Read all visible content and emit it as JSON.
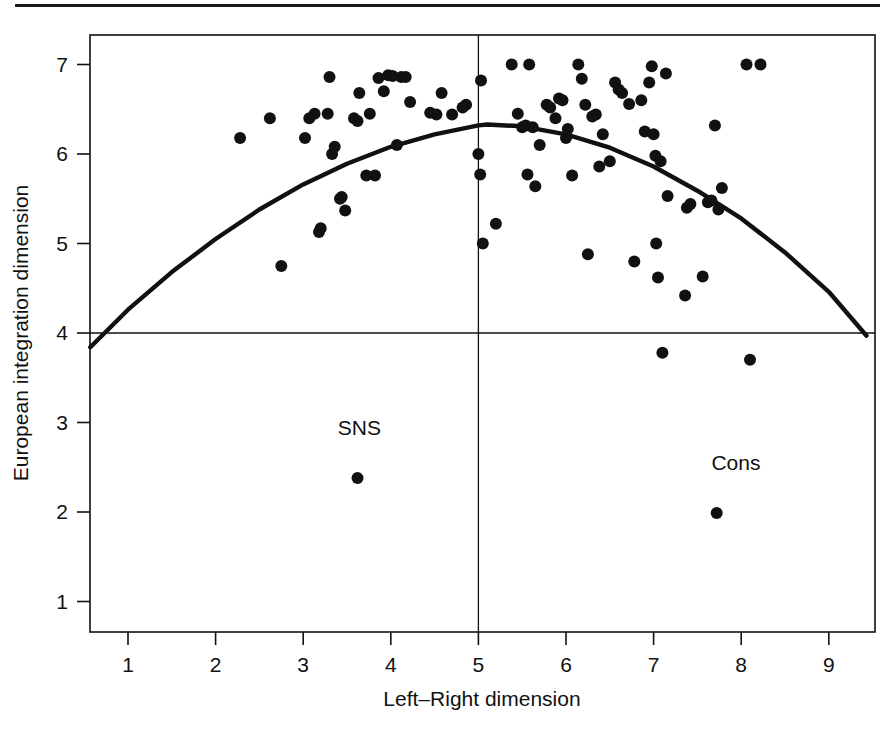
{
  "figure": {
    "background": "#ffffff",
    "ink": "#111111",
    "top_rule": true
  },
  "chart_data": {
    "type": "scatter",
    "title": "",
    "xlabel": "Left–Right dimension",
    "ylabel": "European integration dimension",
    "xlim": [
      0.57,
      9.43
    ],
    "ylim": [
      0.55,
      7.35
    ],
    "xticks": [
      1,
      2,
      3,
      4,
      5,
      6,
      7,
      8,
      9
    ],
    "yticks": [
      1,
      2,
      3,
      4,
      5,
      6,
      7
    ],
    "xticklabels": [
      "1",
      "2",
      "3",
      "4",
      "5",
      "6",
      "7",
      "8",
      "9"
    ],
    "yticklabels": [
      "1",
      "2",
      "3",
      "4",
      "5",
      "6",
      "7"
    ],
    "grid": false,
    "legend": null,
    "reference_lines": [
      {
        "name": "horizontal-reference-line",
        "orientation": "horizontal",
        "value": 4.0
      },
      {
        "name": "vertical-reference-line",
        "orientation": "vertical",
        "value": 5.0
      }
    ],
    "fit_curve": {
      "name": "quadratic-fit-curve",
      "form": "quadratic",
      "vertex_x": 5.1,
      "vertex_y": 6.33,
      "endpoints": [
        [
          0.57,
          3.84
        ],
        [
          9.43,
          3.97
        ]
      ],
      "points": [
        [
          0.57,
          3.84
        ],
        [
          1.0,
          4.26
        ],
        [
          1.5,
          4.68
        ],
        [
          2.0,
          5.05
        ],
        [
          2.5,
          5.38
        ],
        [
          3.0,
          5.66
        ],
        [
          3.5,
          5.89
        ],
        [
          4.0,
          6.08
        ],
        [
          4.5,
          6.22
        ],
        [
          5.0,
          6.32
        ],
        [
          5.1,
          6.33
        ],
        [
          5.5,
          6.31
        ],
        [
          6.0,
          6.22
        ],
        [
          6.5,
          6.07
        ],
        [
          7.0,
          5.86
        ],
        [
          7.5,
          5.59
        ],
        [
          8.0,
          5.28
        ],
        [
          8.5,
          4.9
        ],
        [
          9.0,
          4.46
        ],
        [
          9.43,
          3.97
        ]
      ]
    },
    "points": [
      [
        2.28,
        6.18
      ],
      [
        2.62,
        6.4
      ],
      [
        2.75,
        4.75
      ],
      [
        3.02,
        6.18
      ],
      [
        3.07,
        6.4
      ],
      [
        3.13,
        6.45
      ],
      [
        3.18,
        5.13
      ],
      [
        3.2,
        5.17
      ],
      [
        3.28,
        6.45
      ],
      [
        3.3,
        6.86
      ],
      [
        3.33,
        6.0
      ],
      [
        3.36,
        6.08
      ],
      [
        3.42,
        5.5
      ],
      [
        3.44,
        5.52
      ],
      [
        3.48,
        5.37
      ],
      [
        3.58,
        6.4
      ],
      [
        3.62,
        6.37
      ],
      [
        3.64,
        6.68
      ],
      [
        3.72,
        5.76
      ],
      [
        3.76,
        6.45
      ],
      [
        3.82,
        5.76
      ],
      [
        3.86,
        6.85
      ],
      [
        3.92,
        6.7
      ],
      [
        3.97,
        6.88
      ],
      [
        4.02,
        6.87
      ],
      [
        4.07,
        6.1
      ],
      [
        4.12,
        6.86
      ],
      [
        4.17,
        6.86
      ],
      [
        4.22,
        6.58
      ],
      [
        4.45,
        6.46
      ],
      [
        4.52,
        6.44
      ],
      [
        4.58,
        6.68
      ],
      [
        4.7,
        6.44
      ],
      [
        4.82,
        6.52
      ],
      [
        4.86,
        6.55
      ],
      [
        5.0,
        6.0
      ],
      [
        5.02,
        5.77
      ],
      [
        5.03,
        6.82
      ],
      [
        5.05,
        5.0
      ],
      [
        5.2,
        5.22
      ],
      [
        5.38,
        7.0
      ],
      [
        5.45,
        6.45
      ],
      [
        5.5,
        6.3
      ],
      [
        5.54,
        6.32
      ],
      [
        5.56,
        5.77
      ],
      [
        5.58,
        7.0
      ],
      [
        5.62,
        6.3
      ],
      [
        5.65,
        5.64
      ],
      [
        5.7,
        6.1
      ],
      [
        5.78,
        6.55
      ],
      [
        5.82,
        6.52
      ],
      [
        5.88,
        6.4
      ],
      [
        5.92,
        6.62
      ],
      [
        5.96,
        6.6
      ],
      [
        6.0,
        6.18
      ],
      [
        6.02,
        6.28
      ],
      [
        6.07,
        5.76
      ],
      [
        6.14,
        7.0
      ],
      [
        6.18,
        6.84
      ],
      [
        6.22,
        6.55
      ],
      [
        6.25,
        4.88
      ],
      [
        6.3,
        6.42
      ],
      [
        6.34,
        6.44
      ],
      [
        6.38,
        5.86
      ],
      [
        6.42,
        6.22
      ],
      [
        6.5,
        5.92
      ],
      [
        6.56,
        6.8
      ],
      [
        6.6,
        6.72
      ],
      [
        6.64,
        6.68
      ],
      [
        6.72,
        6.56
      ],
      [
        6.78,
        4.8
      ],
      [
        6.86,
        6.6
      ],
      [
        6.9,
        6.25
      ],
      [
        6.95,
        6.8
      ],
      [
        6.98,
        6.98
      ],
      [
        7.0,
        6.22
      ],
      [
        7.02,
        5.98
      ],
      [
        7.03,
        5.0
      ],
      [
        7.05,
        4.62
      ],
      [
        7.08,
        5.92
      ],
      [
        7.1,
        3.78
      ],
      [
        7.14,
        6.9
      ],
      [
        7.16,
        5.53
      ],
      [
        7.36,
        4.42
      ],
      [
        7.38,
        5.4
      ],
      [
        7.42,
        5.44
      ],
      [
        7.56,
        4.63
      ],
      [
        7.62,
        5.46
      ],
      [
        7.66,
        5.48
      ],
      [
        7.7,
        6.32
      ],
      [
        7.74,
        5.38
      ],
      [
        7.78,
        5.62
      ],
      [
        8.1,
        3.7
      ],
      [
        8.06,
        7.0
      ],
      [
        8.22,
        7.0
      ]
    ],
    "labeled_points": [
      {
        "name": "sns-point",
        "label": "SNS",
        "x": 3.62,
        "y": 2.38,
        "label_dx": 0.02,
        "label_dy": 0.48
      },
      {
        "name": "cons-point",
        "label": "Cons",
        "x": 7.72,
        "y": 1.99,
        "label_dx": 0.22,
        "label_dy": 0.48
      }
    ],
    "marker": {
      "shape": "circle",
      "size_px": 7.2,
      "color": "#111111"
    }
  }
}
